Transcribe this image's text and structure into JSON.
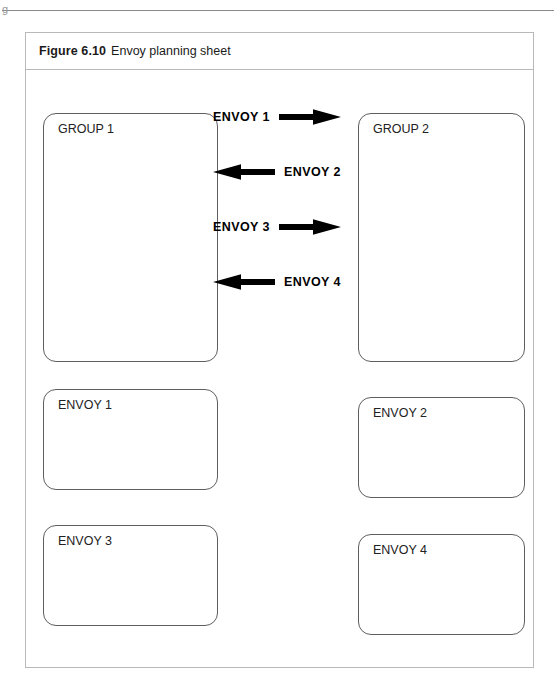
{
  "page": {
    "header_crumb": "g"
  },
  "figure": {
    "number": "Figure 6.10",
    "title": "Envoy planning sheet"
  },
  "groups": [
    {
      "label": "GROUP 1"
    },
    {
      "label": "GROUP 2"
    }
  ],
  "arrows": [
    {
      "label": "ENVOY 1",
      "direction": "right"
    },
    {
      "label": "ENVOY 2",
      "direction": "left"
    },
    {
      "label": "ENVOY 3",
      "direction": "right"
    },
    {
      "label": "ENVOY 4",
      "direction": "left"
    }
  ],
  "envoy_boxes": [
    {
      "label": "ENVOY 1"
    },
    {
      "label": "ENVOY 2"
    },
    {
      "label": "ENVOY 3"
    },
    {
      "label": "ENVOY 4"
    }
  ],
  "colors": {
    "frame_border": "#b9b9b9",
    "box_border": "#5e5e5e",
    "arrow_fill": "#000000",
    "text": "#1b1b1b",
    "rule": "#8a8a8a"
  }
}
